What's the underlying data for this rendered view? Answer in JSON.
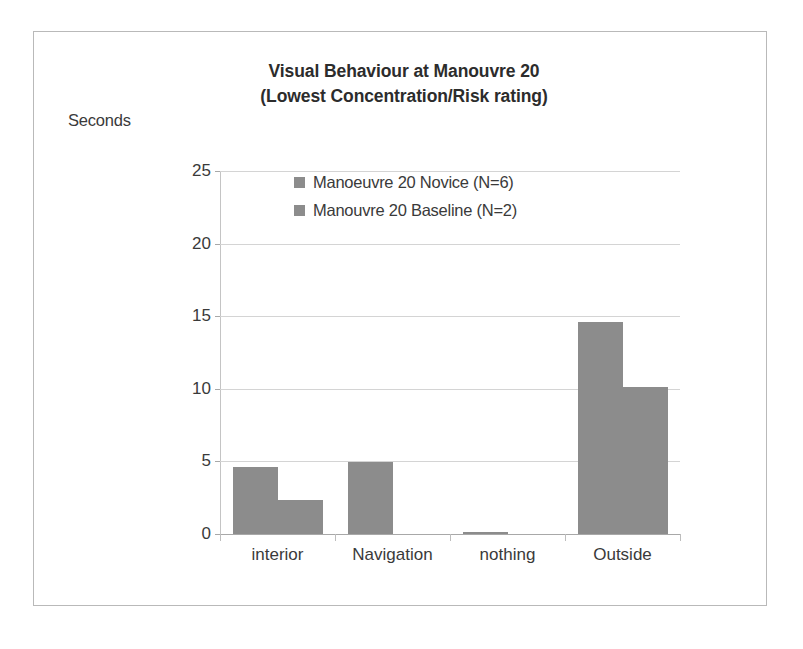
{
  "chart_data": {
    "type": "bar",
    "title": "Visual Behaviour at Manouvre 20 (Lowest Concentration/Risk rating)",
    "title_line1": "Visual Behaviour at Manouvre 20",
    "title_line2": "(Lowest Concentration/Risk rating)",
    "xlabel": "",
    "ylabel": "Seconds",
    "categories": [
      "interior",
      "Navigation",
      "nothing",
      "Outside"
    ],
    "series": [
      {
        "name": "Manoeuvre 20 Novice (N=6)",
        "color": "#8c8c8c",
        "values": [
          4.6,
          4.95,
          0.15,
          14.6
        ]
      },
      {
        "name": "Manouvre 20 Baseline (N=2)",
        "color": "#8c8c8c",
        "values": [
          2.35,
          0,
          0,
          10.1
        ]
      }
    ],
    "ylim": [
      0,
      25
    ],
    "yticks": [
      0,
      5,
      10,
      15,
      20,
      25
    ],
    "ytick_labels": [
      "0",
      "5",
      "10",
      "15",
      "20",
      "25"
    ],
    "grid": true,
    "legend_position": "inside-top-left"
  },
  "legend": {
    "items": [
      {
        "label": "Manoeuvre 20 Novice (N=6)"
      },
      {
        "label": "Manouvre 20 Baseline (N=2)"
      }
    ]
  }
}
